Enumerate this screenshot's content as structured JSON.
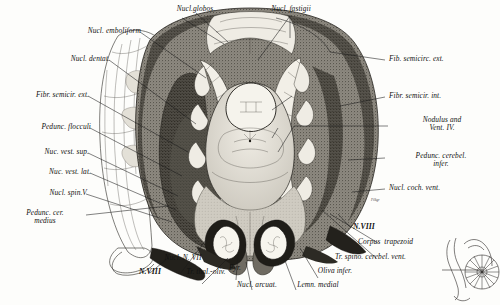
{
  "figure": {
    "kind": "histological-section-plate",
    "background_color": "#fdfdfb",
    "ink_color": "#1a1a1a"
  },
  "labels": {
    "top": [
      {
        "id": "nucl-globos",
        "text": "Nucl.globos.",
        "side": "top"
      },
      {
        "id": "nucl-fastigii",
        "text": "Nucl. fastigii",
        "side": "top"
      }
    ],
    "left": [
      {
        "id": "nucl-emboliform",
        "text": "Nucl. emboliform"
      },
      {
        "id": "nucl-dentat",
        "text": "Nucl. dentat."
      },
      {
        "id": "fibr-semicir-ext",
        "text": "Fibr. semicir. ext."
      },
      {
        "id": "pedunc-flocculi",
        "text": "Pedunc. flocculi"
      },
      {
        "id": "nuc-vest-sup",
        "text": "Nuc. vest. sup."
      },
      {
        "id": "nuc-vest-lat",
        "text": "Nuc. vest. lat."
      },
      {
        "id": "nucl-spin-v",
        "text": "Nucl. spin.V"
      },
      {
        "id": "pedunc-cer-medius",
        "text": "Pedunc. cer.\nmedius"
      }
    ],
    "right": [
      {
        "id": "fib-semicirc-ext",
        "text": "Fib. semicirc. ext."
      },
      {
        "id": "fibr-semicir-int",
        "text": "Fibr. semicir. int."
      },
      {
        "id": "nodulus-vent-iv",
        "text": "Nodulus and\nVent. IV."
      },
      {
        "id": "pedunc-cerebel-infer",
        "text": "Pedunc. cerebel.\ninfer."
      },
      {
        "id": "nucl-coch-vent",
        "text": "Nucl. coch. vent."
      },
      {
        "id": "n-viii-right",
        "text": "N.VIII",
        "style": "nerve"
      },
      {
        "id": "corpus-trapezoid",
        "text": "Corpus  trapezoid"
      },
      {
        "id": "tr-spino-cerebel-vent",
        "text": "Tr. spino. cerebel. vent."
      }
    ],
    "bottom": [
      {
        "id": "n-viii-left",
        "text": "N.VIII",
        "style": "nerve"
      },
      {
        "id": "nucl-n-vii",
        "text": "Nucl. N. VII"
      },
      {
        "id": "tr-thal-oliv",
        "text": "Tr. thal.-oliv."
      },
      {
        "id": "pyr",
        "text": "Pyr."
      },
      {
        "id": "nucl-arcuat",
        "text": "Nucl. arcuat."
      },
      {
        "id": "lemn-medial",
        "text": "Lemn. medial"
      },
      {
        "id": "oliva-infer",
        "text": "Oliva infer."
      }
    ]
  },
  "inset": {
    "id": "orientation-inset",
    "description": "small sagittal orientation diagram of brainstem and cerebellum with section level line"
  },
  "signature": {
    "text": "Filkgr"
  }
}
